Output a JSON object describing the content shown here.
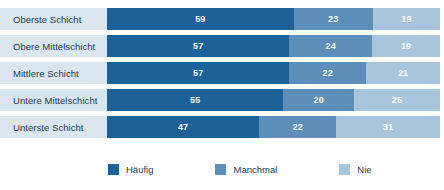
{
  "chart_data": {
    "type": "bar",
    "orientation": "horizontal",
    "stacked": true,
    "normalized": true,
    "title": "",
    "subtitle": "",
    "xlabel": "",
    "ylabel": "",
    "grid": false,
    "legend_position": "bottom",
    "categories": [
      "Oberste Schicht",
      "Obere Mittelschicht",
      "Mittlere Schicht",
      "Untere Mittelschicht",
      "Unterste Schicht"
    ],
    "series": [
      {
        "name": "Häufig",
        "color": "#1c6198",
        "values": [
          59,
          57,
          57,
          55,
          47
        ]
      },
      {
        "name": "Manchmal",
        "color": "#5e8fba",
        "values": [
          23,
          24,
          22,
          20,
          22
        ]
      },
      {
        "name": "Nie",
        "color": "#a9c5dd",
        "values": [
          19,
          19,
          21,
          25,
          31
        ]
      }
    ],
    "rows": [
      {
        "label": "Oberste Schicht",
        "segments": [
          {
            "series": "Häufig",
            "value": 59,
            "value_label": "59"
          },
          {
            "series": "Manchmal",
            "value": 23,
            "value_label": "23"
          },
          {
            "series": "Nie",
            "value": 19,
            "value_label": "19"
          }
        ]
      },
      {
        "label": "Obere Mittelschicht",
        "segments": [
          {
            "series": "Häufig",
            "value": 57,
            "value_label": "57"
          },
          {
            "series": "Manchmal",
            "value": 24,
            "value_label": "24"
          },
          {
            "series": "Nie",
            "value": 19,
            "value_label": "19"
          }
        ]
      },
      {
        "label": "Mittlere Schicht",
        "segments": [
          {
            "series": "Häufig",
            "value": 57,
            "value_label": "57"
          },
          {
            "series": "Manchmal",
            "value": 22,
            "value_label": "22"
          },
          {
            "series": "Nie",
            "value": 21,
            "value_label": "21"
          }
        ]
      },
      {
        "label": "Untere Mittelschicht",
        "segments": [
          {
            "series": "Häufig",
            "value": 55,
            "value_label": "55"
          },
          {
            "series": "Manchmal",
            "value": 20,
            "value_label": "20"
          },
          {
            "series": "Nie",
            "value": 25,
            "value_label": "25"
          }
        ]
      },
      {
        "label": "Unterste Schicht",
        "segments": [
          {
            "series": "Häufig",
            "value": 47,
            "value_label": "47"
          },
          {
            "series": "Manchmal",
            "value": 22,
            "value_label": "22"
          },
          {
            "series": "Nie",
            "value": 31,
            "value_label": "31"
          }
        ]
      }
    ],
    "legend": [
      {
        "label": "Häufig",
        "color": "#1c6198"
      },
      {
        "label": "Manchmal",
        "color": "#5e8fba"
      },
      {
        "label": "Nie",
        "color": "#a9c5dd"
      }
    ]
  },
  "style": {
    "label_band_bg": "#dbe7f0",
    "label_text_color": "#1d3a55",
    "value_text_color": "#ffffff",
    "page_bg": "#ffffff"
  }
}
